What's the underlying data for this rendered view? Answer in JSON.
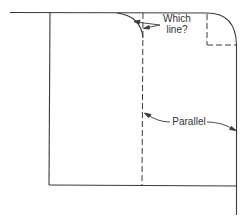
{
  "diagram": {
    "labels": {
      "which_line": [
        "Which",
        "line?"
      ],
      "parallel": "Parallel"
    },
    "colors": {
      "line": "#3a3a3a",
      "background": "#ffffff"
    }
  }
}
